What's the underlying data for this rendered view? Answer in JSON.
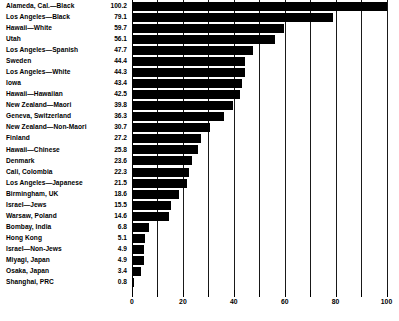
{
  "chart_data": {
    "type": "bar",
    "orientation": "horizontal",
    "title": "",
    "subtitle": "",
    "xlabel": "",
    "ylabel": "",
    "xlim": [
      0,
      102
    ],
    "xticks": [
      0,
      20,
      40,
      60,
      80,
      100
    ],
    "xtick_labels": [
      "0",
      "20",
      "40",
      "60",
      "80",
      "100"
    ],
    "minor_xticks": [
      10,
      30,
      50,
      70,
      90
    ],
    "gridlines": [
      0,
      10,
      20,
      30,
      40,
      50,
      60,
      70,
      80,
      90,
      100
    ],
    "grid": true,
    "legend": null,
    "bar_color": "#000000",
    "categories": [
      "Alameda, Cal.—Black",
      "Los Angeles—Black",
      "Hawaii—White",
      "Utah",
      "Los Angeles—Spanish",
      "Sweden",
      "Los Angeles—White",
      "Iowa",
      "Hawaii—Hawaiian",
      "New Zealand—Maori",
      "Geneva, Switzerland",
      "New Zealand—Non-Maori",
      "Finland",
      "Hawaii—Chinese",
      "Denmark",
      "Cali, Colombia",
      "Los Angeles—Japanese",
      "Birmingham, UK",
      "Israel—Jews",
      "Warsaw, Poland",
      "Bombay, India",
      "Hong Kong",
      "Israel—Non-Jews",
      "Miyagi, Japan",
      "Osaka, Japan",
      "Shanghai, PRC"
    ],
    "values": [
      100.2,
      79.1,
      59.7,
      56.1,
      47.7,
      44.4,
      44.3,
      43.4,
      42.5,
      39.8,
      36.3,
      30.7,
      27.2,
      25.8,
      23.6,
      22.3,
      21.5,
      18.6,
      15.5,
      14.6,
      6.8,
      5.1,
      4.9,
      4.9,
      3.4,
      0.8
    ],
    "value_labels": [
      "100.2",
      "79.1",
      "59.7",
      "56.1",
      "47.7",
      "44.4",
      "44.3",
      "43.4",
      "42.5",
      "39.8",
      "36.3",
      "30.7",
      "27.2",
      "25.8",
      "23.6",
      "22.3",
      "21.5",
      "18.6",
      "15.5",
      "14.6",
      "6.8",
      "5.1",
      "4.9",
      "4.9",
      "3.4",
      "0.8"
    ]
  }
}
